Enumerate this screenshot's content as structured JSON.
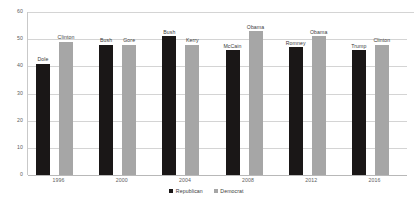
{
  "chart_data": {
    "type": "bar",
    "title": "",
    "subtitle": "",
    "xlabel": "",
    "ylabel": "",
    "ylim": [
      0,
      60
    ],
    "yticks": [
      0,
      10,
      20,
      30,
      40,
      50,
      60
    ],
    "grid": true,
    "legend_position": "bottom-center",
    "categories": [
      "1996",
      "2000",
      "2004",
      "2008",
      "2012",
      "2016"
    ],
    "series": [
      {
        "name": "Republican",
        "color": "#1a1717",
        "values": [
          41,
          48,
          51,
          46,
          47,
          46
        ],
        "point_labels": [
          "Dole",
          "Bush",
          "Bush",
          "McCain",
          "Romney",
          "Trump"
        ]
      },
      {
        "name": "Democrat",
        "color": "#a6a6a6",
        "values": [
          49,
          48,
          48,
          53,
          51,
          48
        ],
        "point_labels": [
          "Clinton",
          "Gore",
          "Kerry",
          "Obama",
          "Obama",
          "Clinton"
        ]
      }
    ]
  },
  "legend": {
    "items": [
      {
        "label": "Republican",
        "marker": "legend-swatch-republican"
      },
      {
        "label": "Democrat",
        "marker": "legend-swatch-democrat"
      }
    ]
  },
  "axes": {
    "y_tick_labels": [
      "60",
      "50",
      "40",
      "30",
      "20",
      "10",
      "0"
    ],
    "x_tick_labels": [
      "1996",
      "2000",
      "2004",
      "2008",
      "2012",
      "2016"
    ]
  }
}
